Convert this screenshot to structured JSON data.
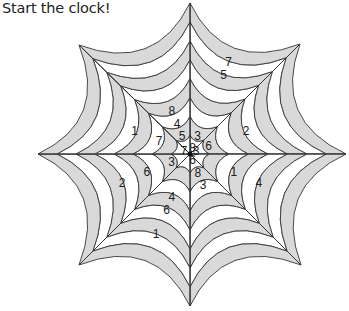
{
  "title": "Start the clock!",
  "colors": {
    "band_fill": "#d9d9d9",
    "line": "#333333",
    "background": "#ffffff"
  },
  "web": {
    "spokes": 8,
    "rings": 8,
    "labels": [
      {
        "text": "8",
        "ring": 4,
        "dir": "up-left"
      },
      {
        "text": "4",
        "ring": 3,
        "dir": "up-left"
      },
      {
        "text": "5",
        "ring": 2,
        "dir": "up-left"
      },
      {
        "text": "3",
        "ring": 2,
        "dir": "up-right"
      },
      {
        "text": "8",
        "ring": 1,
        "dir": "up-right"
      },
      {
        "text": "3",
        "ring": 1,
        "dir": "right-up"
      },
      {
        "text": "6",
        "ring": 2,
        "dir": "right-up"
      },
      {
        "text": "7",
        "ring": 1,
        "dir": "left-up"
      },
      {
        "text": "6",
        "ring": 1,
        "dir": "down-right"
      },
      {
        "text": "8",
        "ring": 2,
        "dir": "down-right"
      },
      {
        "text": "3",
        "ring": 2,
        "dir": "left-down"
      },
      {
        "text": "7",
        "ring": 3,
        "dir": "left-up"
      },
      {
        "text": "1",
        "ring": 5,
        "dir": "left-up"
      },
      {
        "text": "7",
        "ring": 8,
        "dir": "up-right"
      },
      {
        "text": "5",
        "ring": 7,
        "dir": "up-right"
      },
      {
        "text": "2",
        "ring": 5,
        "dir": "right-up"
      },
      {
        "text": "1",
        "ring": 4,
        "dir": "right-down"
      },
      {
        "text": "4",
        "ring": 6,
        "dir": "right-down"
      },
      {
        "text": "3",
        "ring": 3,
        "dir": "down-right"
      },
      {
        "text": "2",
        "ring": 6,
        "dir": "left-down"
      },
      {
        "text": "6",
        "ring": 4,
        "dir": "left-down"
      },
      {
        "text": "4",
        "ring": 4,
        "dir": "down-left"
      },
      {
        "text": "6",
        "ring": 5,
        "dir": "down-left"
      },
      {
        "text": "1",
        "ring": 7,
        "dir": "down-left"
      }
    ]
  }
}
